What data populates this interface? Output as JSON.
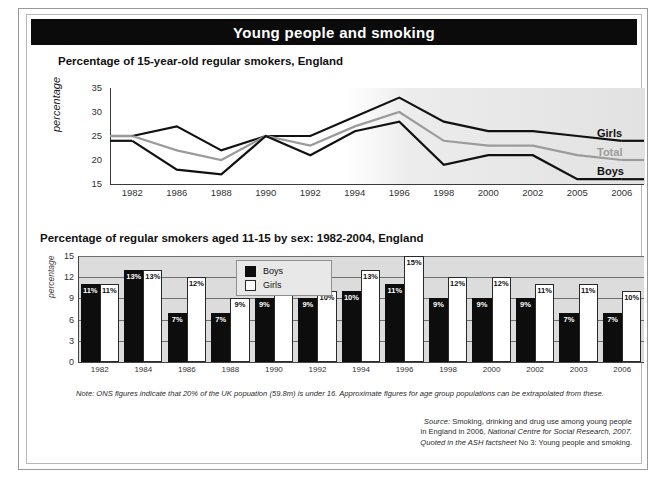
{
  "banner": {
    "title": "Young people and smoking"
  },
  "sections": {
    "top_title": "Percentage of 15-year-old regular smokers, England",
    "bottom_title": "Percentage of regular smokers aged 11-15 by sex: 1982-2004, England"
  },
  "legend": {
    "girls": "Girls",
    "total": "Total",
    "boys": "Boys"
  },
  "footer": {
    "note": "Note: ONS figures indicate that 20% of the UK popuation (59.8m) is under 16. Approximate figures for age group populations can be extrapolated from these.",
    "source_line1_prefix": "Source:",
    "source_line1": "Smoking, drinking and drug use among young people",
    "source_line2_a": "in England in 2006,",
    "source_line2_b": "National Centre for Social Research, 2007.",
    "source_line3_a": "Quoted in the ASH factsheet",
    "source_line3_b": "No 3: Young people and smoking."
  },
  "colors": {
    "banner_bg": "#0b0b0b",
    "boys_line": "#111111",
    "girls_line": "#111111",
    "total_line": "#9b9b9b",
    "bar_boys": "#0d0d0d",
    "bar_girls": "#ffffff",
    "plot_bg": "#dcdcdc"
  },
  "chart_data": [
    {
      "type": "line",
      "title": "Percentage of 15-year-old regular smokers, England",
      "xlabel": "",
      "ylabel": "percentage",
      "ylim": [
        15,
        35
      ],
      "yticks": [
        15,
        20,
        25,
        30,
        35
      ],
      "grid": false,
      "legend_position": "right-inline",
      "x": [
        "1982",
        "1986",
        "1988",
        "1990",
        "1992",
        "1994",
        "1996",
        "1998",
        "2000",
        "2002",
        "2005",
        "2006"
      ],
      "series": [
        {
          "name": "Girls",
          "color": "#111111",
          "values": [
            25,
            27,
            22,
            25,
            25,
            29,
            33,
            28,
            26,
            26,
            25,
            24
          ]
        },
        {
          "name": "Total",
          "color": "#9b9b9b",
          "values": [
            25,
            22,
            20,
            25,
            23,
            27,
            30,
            24,
            23,
            23,
            21,
            20
          ]
        },
        {
          "name": "Boys",
          "color": "#111111",
          "values": [
            24,
            18,
            17,
            25,
            21,
            26,
            28,
            19,
            21,
            21,
            16,
            16
          ]
        }
      ]
    },
    {
      "type": "bar",
      "title": "Percentage of regular smokers aged 11-15 by sex: 1982-2004, England",
      "xlabel": "",
      "ylabel": "percentage",
      "ylim": [
        0,
        15
      ],
      "yticks": [
        0,
        3,
        6,
        9,
        12,
        15
      ],
      "grid": true,
      "legend_position": "inside-top-left",
      "categories": [
        "1982",
        "1984",
        "1986",
        "1988",
        "1990",
        "1992",
        "1994",
        "1996",
        "1998",
        "2000",
        "2002",
        "2003",
        "2006"
      ],
      "series": [
        {
          "name": "Boys",
          "color": "#0d0d0d",
          "values": [
            11,
            13,
            7,
            7,
            9,
            9,
            10,
            11,
            9,
            9,
            9,
            7,
            7
          ]
        },
        {
          "name": "Girls",
          "color": "#ffffff",
          "values": [
            11,
            13,
            12,
            9,
            11,
            10,
            13,
            15,
            12,
            12,
            11,
            11,
            10
          ]
        }
      ],
      "value_suffix": "%"
    }
  ]
}
